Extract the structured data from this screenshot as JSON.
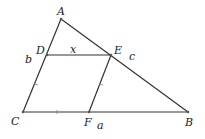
{
  "diagram": {
    "background": "#ffffff",
    "line_color": "#333333",
    "points": {
      "A": {
        "label": "A",
        "x": 61,
        "y": 19
      },
      "B": {
        "label": "B",
        "x": 188,
        "y": 112
      },
      "C": {
        "label": "C",
        "x": 23,
        "y": 112
      },
      "D": {
        "label": "D",
        "x": 47,
        "y": 55
      },
      "E": {
        "label": "E",
        "x": 111,
        "y": 55
      },
      "F": {
        "label": "F",
        "x": 89,
        "y": 112
      }
    },
    "segments": [
      {
        "from": "A",
        "to": "C"
      },
      {
        "from": "A",
        "to": "B"
      },
      {
        "from": "C",
        "to": "B"
      },
      {
        "from": "D",
        "to": "E"
      },
      {
        "from": "E",
        "to": "F"
      }
    ],
    "side_labels": {
      "x": "x",
      "a": "a",
      "b": "b",
      "c": "c"
    }
  }
}
